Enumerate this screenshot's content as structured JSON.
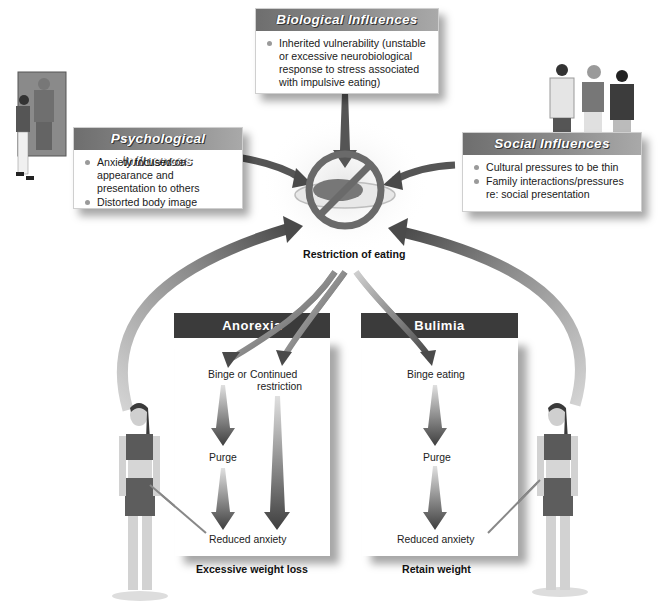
{
  "diagram": {
    "center": {
      "label": "Restriction of eating",
      "icon": "no-food-plate-icon"
    },
    "influences": {
      "biological": {
        "title": "Biological Influences",
        "items": [
          "Inherited vulnerability (unstable or excessive neurobiological response to stress associated with impulsive eating)"
        ]
      },
      "psychological": {
        "title": "Psychological Influences",
        "items": [
          "Anxiety focused on appearance and presentation to others",
          "Distorted body image"
        ]
      },
      "social": {
        "title": "Social Influences",
        "items": [
          "Cultural pressures to be thin",
          "Family interactions/pressures re: social presentation"
        ]
      }
    },
    "anorexia": {
      "title": "Anorexia",
      "binge_or": "Binge or",
      "continued_restriction": [
        "Continued",
        "restriction"
      ],
      "purge": "Purge",
      "reduced_anxiety": "Reduced anxiety",
      "outcome": "Excessive weight loss"
    },
    "bulimia": {
      "title": "Bulimia",
      "binge_eating": "Binge eating",
      "purge": "Purge",
      "reduced_anxiety": "Reduced anxiety",
      "outcome": "Retain weight"
    },
    "colors": {
      "header_dark": "#3b3b3b",
      "arrow_dark": "#4a4a4a",
      "arrow_light": "#c8c8c8",
      "bullet": "#9a9a9a"
    }
  }
}
